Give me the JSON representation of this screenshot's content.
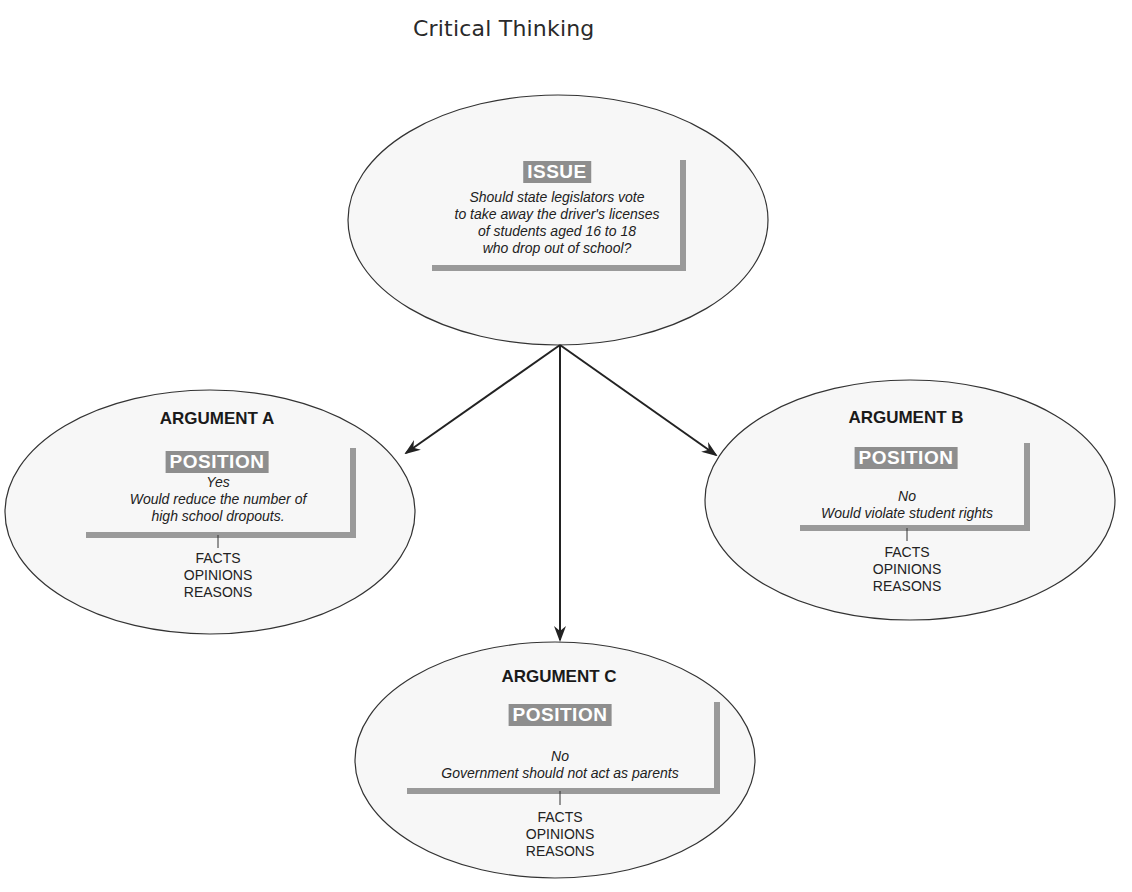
{
  "title": "Critical Thinking",
  "colors": {
    "ellipse_fill": "#f7f7f7",
    "ellipse_stroke": "#333333",
    "bracket_gray": "#9a9a9a",
    "label_box_gray": "#8e8e8e",
    "arrow": "#222222"
  },
  "issue": {
    "label": "ISSUE",
    "lines": [
      "Should state legislators vote",
      "to take away the driver's licenses",
      "of students aged 16 to 18",
      "who drop out of school?"
    ]
  },
  "arguments": [
    {
      "heading": "ARGUMENT A",
      "label": "POSITION",
      "stance": "Yes",
      "lines": [
        "Would reduce the number of",
        "high school dropouts."
      ],
      "support": [
        "FACTS",
        "OPINIONS",
        "REASONS"
      ]
    },
    {
      "heading": "ARGUMENT B",
      "label": "POSITION",
      "stance": "No",
      "lines": [
        "Would violate student rights"
      ],
      "support": [
        "FACTS",
        "OPINIONS",
        "REASONS"
      ]
    },
    {
      "heading": "ARGUMENT C",
      "label": "POSITION",
      "stance": "No",
      "lines": [
        "Government should not act as parents"
      ],
      "support": [
        "FACTS",
        "OPINIONS",
        "REASONS"
      ]
    }
  ],
  "edges": [
    {
      "from": "issue",
      "to": "argument-a"
    },
    {
      "from": "issue",
      "to": "argument-b"
    },
    {
      "from": "issue",
      "to": "argument-c"
    }
  ]
}
